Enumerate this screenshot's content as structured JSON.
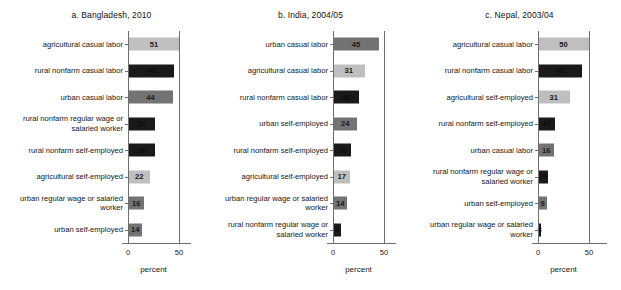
{
  "figure": {
    "axis_caption": "percent",
    "x_ticks": [
      "0",
      "50"
    ],
    "colors": {
      "agricultural": "#bfbfbf",
      "urban": "#737373",
      "rural_nonfarm": "#1a1a1a",
      "axis": "#6e6e6e",
      "value_text_light_bar": "#1a1a1a",
      "value_text_dark_bar": "#0d0d0d"
    }
  },
  "chart_data": [
    {
      "type": "bar",
      "orientation": "horizontal",
      "title": "a. Bangladesh, 2010",
      "xlabel": "percent",
      "ylabel": "",
      "xlim": [
        0,
        50
      ],
      "xticks": [
        0,
        50
      ],
      "grid": false,
      "legend": "none",
      "categories": [
        "agricultural casual labor",
        "rural nonfarm casual labor",
        "urban casual labor",
        "rural nonfarm regular wage or salaried worker",
        "rural nonfarm self-employed",
        "agricultural self-employed",
        "urban regular wage or salaried worker",
        "urban self-employed"
      ],
      "values": [
        51,
        45,
        44,
        26,
        26,
        22,
        16,
        14
      ],
      "bar_groups": [
        "agricultural",
        "rural_nonfarm",
        "urban",
        "rural_nonfarm",
        "rural_nonfarm",
        "agricultural",
        "urban",
        "urban"
      ]
    },
    {
      "type": "bar",
      "orientation": "horizontal",
      "title": "b. India, 2004/05",
      "xlabel": "percent",
      "ylabel": "",
      "xlim": [
        0,
        50
      ],
      "xticks": [
        0,
        50
      ],
      "grid": false,
      "legend": "none",
      "categories": [
        "urban casual labor",
        "agricultural casual labor",
        "rural nonfarm casual labor",
        "urban self-employed",
        "rural nonfarm self-employed",
        "agricultural self-employed",
        "urban regular wage or salaried worker",
        "rural nonfarm regular wage or salaried worker"
      ],
      "values": [
        45,
        31,
        25,
        24,
        18,
        17,
        14,
        8
      ],
      "bar_groups": [
        "urban",
        "agricultural",
        "rural_nonfarm",
        "urban",
        "rural_nonfarm",
        "agricultural",
        "urban",
        "rural_nonfarm"
      ]
    },
    {
      "type": "bar",
      "orientation": "horizontal",
      "title": "c. Nepal, 2003/04",
      "xlabel": "percent",
      "ylabel": "",
      "xlim": [
        0,
        50
      ],
      "xticks": [
        0,
        50
      ],
      "grid": false,
      "legend": "none",
      "categories": [
        "agricultural casual labor",
        "rural nonfarm casual labor",
        "agricultural self-employed",
        "rural nonfarm self-employed",
        "urban casual labor",
        "rural nonfarm regular wage or salaried worker",
        "urban self-employed",
        "urban regular wage or salaried worker"
      ],
      "values": [
        50,
        43,
        31,
        17,
        16,
        10,
        9,
        3
      ],
      "bar_groups": [
        "agricultural",
        "rural_nonfarm",
        "agricultural",
        "rural_nonfarm",
        "urban",
        "rural_nonfarm",
        "urban",
        "rural_nonfarm"
      ]
    }
  ]
}
